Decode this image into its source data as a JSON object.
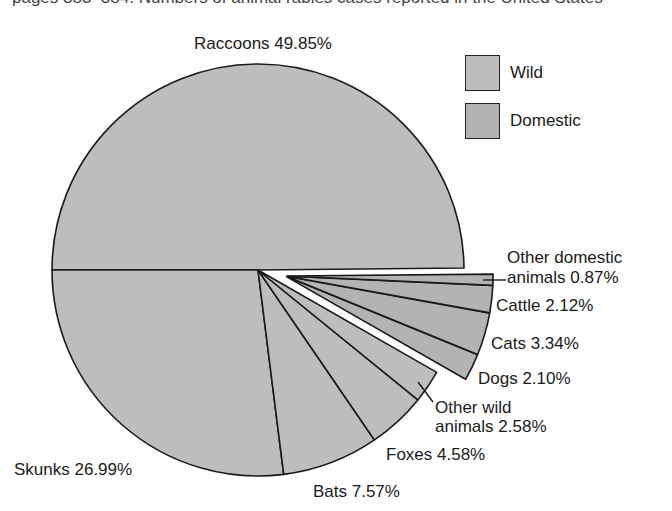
{
  "header": {
    "partial_text": "pages 383–384. Numbers of animal rabies cases reported in the United States"
  },
  "legend": {
    "items": [
      {
        "label": "Wild",
        "color": "#bdbdbd"
      },
      {
        "label": "Domestic",
        "color": "#b3b3b3"
      }
    ]
  },
  "labels": {
    "raccoons": "Raccoons 49.85%",
    "skunks": "Skunks 26.99%",
    "bats": "Bats 7.57%",
    "foxes": "Foxes 4.58%",
    "other_wild_1": "Other wild",
    "other_wild_2": "animals 2.58%",
    "dogs": "Dogs 2.10%",
    "cats": "Cats 3.34%",
    "cattle": "Cattle 2.12%",
    "other_domestic_1": "Other domestic",
    "other_domestic_2": "animals 0.87%"
  },
  "chart_data": {
    "type": "pie",
    "title": "",
    "categories": [
      "Raccoons",
      "Skunks",
      "Bats",
      "Foxes",
      "Other wild animals",
      "Dogs",
      "Cats",
      "Cattle",
      "Other domestic animals"
    ],
    "values": [
      49.85,
      26.99,
      7.57,
      4.58,
      2.58,
      2.1,
      3.34,
      2.12,
      0.87
    ],
    "groups": [
      "Wild",
      "Wild",
      "Wild",
      "Wild",
      "Wild",
      "Domestic",
      "Domestic",
      "Domestic",
      "Domestic"
    ],
    "unit": "%",
    "legend": [
      "Wild",
      "Domestic"
    ],
    "legend_position": "top-right",
    "exploded": [
      "Dogs",
      "Cats",
      "Cattle",
      "Other domestic animals"
    ],
    "colors": {
      "Wild": "#bdbdbd",
      "Domestic": "#b3b3b3",
      "outline": "#1a1a1a"
    }
  }
}
